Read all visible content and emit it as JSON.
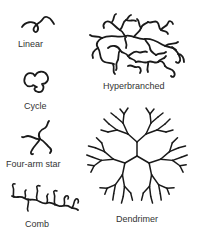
{
  "diagram": {
    "stroke_color": "#1a1a1a",
    "label_color": "#333333",
    "items": [
      {
        "id": "linear",
        "label": "Linear"
      },
      {
        "id": "cycle",
        "label": "Cycle"
      },
      {
        "id": "four-arm-star",
        "label": "Four-arm star"
      },
      {
        "id": "comb",
        "label": "Comb"
      },
      {
        "id": "hyperbranched",
        "label": "Hyperbranched"
      },
      {
        "id": "dendrimer",
        "label": "Dendrimer"
      }
    ]
  }
}
